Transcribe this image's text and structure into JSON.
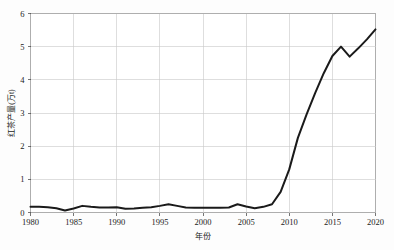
{
  "chart_data": {
    "type": "line",
    "title": "",
    "xlabel": "年份",
    "ylabel": "红茶产量(万t)",
    "xlim": [
      1980,
      2020
    ],
    "ylim": [
      0,
      6
    ],
    "grid": true,
    "legend": false,
    "xticks": [
      1980,
      1985,
      1990,
      1995,
      2000,
      2005,
      2010,
      2015,
      2020
    ],
    "yticks": [
      0,
      1,
      2,
      3,
      4,
      5,
      6
    ],
    "series": [
      {
        "name": "红茶产量",
        "color": "#1a1a1a",
        "x": [
          1980,
          1981,
          1982,
          1983,
          1984,
          1985,
          1986,
          1987,
          1988,
          1989,
          1990,
          1991,
          1992,
          1993,
          1994,
          1995,
          1996,
          1997,
          1998,
          1999,
          2000,
          2001,
          2002,
          2003,
          2004,
          2005,
          2006,
          2007,
          2008,
          2009,
          2010,
          2011,
          2012,
          2013,
          2014,
          2015,
          2016,
          2017,
          2018,
          2019,
          2020
        ],
        "values": [
          0.17,
          0.17,
          0.16,
          0.13,
          0.06,
          0.12,
          0.2,
          0.17,
          0.15,
          0.15,
          0.16,
          0.11,
          0.12,
          0.14,
          0.16,
          0.2,
          0.25,
          0.2,
          0.15,
          0.14,
          0.14,
          0.14,
          0.14,
          0.15,
          0.25,
          0.18,
          0.13,
          0.17,
          0.25,
          0.62,
          1.3,
          2.25,
          2.95,
          3.6,
          4.2,
          4.72,
          5.0,
          4.7,
          4.95,
          5.22,
          5.52
        ]
      }
    ]
  },
  "axes": {
    "x_tick_labels": [
      "1980",
      "1985",
      "1990",
      "1995",
      "2000",
      "2005",
      "2010",
      "2015",
      "2020"
    ],
    "y_tick_labels": [
      "0",
      "1",
      "2",
      "3",
      "4",
      "5",
      "6"
    ],
    "x_axis_title": "年份",
    "y_axis_title": "红茶产量(万t)"
  },
  "colors": {
    "line": "#1a1a1a",
    "grid": "#c8c8c8",
    "frame": "#9a9a9a",
    "background": "#fdfdfd",
    "plot_background": "#ffffff",
    "text": "#1b1b1b"
  }
}
